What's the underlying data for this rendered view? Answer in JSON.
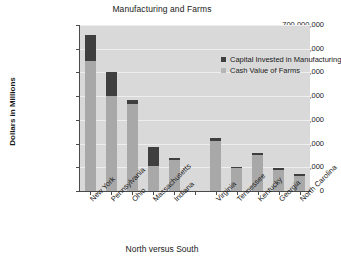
{
  "chart_data": {
    "type": "bar",
    "subtype": "stacked-bar",
    "title": "Manufacturing and Farms",
    "xlabel": "North versus South",
    "ylabel": "Dollars in Millions",
    "ylim": [
      0,
      700000000
    ],
    "grid": true,
    "legend_position": "top-right-inside",
    "ytick_labels": [
      "700,000,000",
      "600,000,000",
      "500,000,000",
      "400,000,000",
      "300,000,000",
      "200,000,000",
      "100,000,000",
      "0"
    ],
    "ytick_values": [
      700000000,
      600000000,
      500000000,
      400000000,
      300000000,
      200000000,
      100000000,
      0
    ],
    "categories": [
      "New York",
      "Pennsylvania",
      "Ohio",
      "Massachusetts",
      "Indiana",
      "",
      "Virginia",
      "Tennessee",
      "Kentucky",
      "Georgia",
      "North Carolina"
    ],
    "series": [
      {
        "name": "Cash Value of Farms",
        "color": "#a8a8a8",
        "values": [
          550000000,
          400000000,
          365000000,
          105000000,
          130000000,
          null,
          210000000,
          95000000,
          150000000,
          90000000,
          65000000
        ]
      },
      {
        "name": "Capital Invested in Manufacturing",
        "color": "#3f3f3f",
        "values": [
          110000000,
          100000000,
          17000000,
          80000000,
          10000000,
          null,
          13000000,
          7000000,
          10000000,
          7000000,
          6000000
        ]
      }
    ],
    "totals": [
      660000000,
      500000000,
      382000000,
      185000000,
      140000000,
      null,
      223000000,
      102000000,
      160000000,
      97000000,
      71000000
    ]
  },
  "legend": {
    "items": [
      {
        "label": "Capital Invested in Manufacturing",
        "swatch": "dark"
      },
      {
        "label": "Cash Value of Farms",
        "swatch": "light"
      }
    ]
  }
}
